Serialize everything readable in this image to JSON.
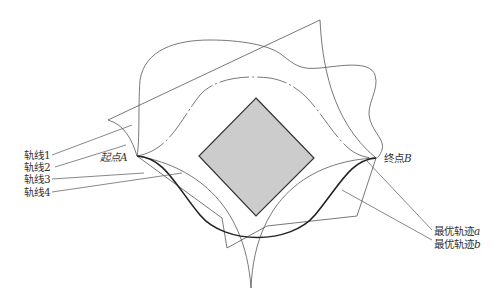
{
  "diagram": {
    "type": "trajectory-planning-schematic",
    "obstacle": {
      "shape": "diamond",
      "fill": "#cccccc",
      "stroke": "#333333"
    },
    "start_point": {
      "prefix": "起点",
      "var": "A"
    },
    "end_point": {
      "prefix": "终点",
      "var": "B"
    },
    "left_labels": [
      {
        "text": "轨线1"
      },
      {
        "text": "轨线2"
      },
      {
        "text": "轨线3"
      },
      {
        "text": "轨线4"
      }
    ],
    "right_labels": [
      {
        "prefix": "最优轨迹",
        "var": "a"
      },
      {
        "prefix": "最优轨迹",
        "var": "b"
      }
    ],
    "colors": {
      "line": "#555555",
      "bold_line": "#222222",
      "obstacle_fill": "#cccccc"
    }
  }
}
